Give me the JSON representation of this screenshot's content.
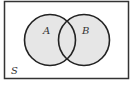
{
  "diagram": {
    "type": "venn",
    "universe": {
      "label": "S"
    },
    "sets": [
      {
        "label": "A"
      },
      {
        "label": "B"
      }
    ],
    "colors": {
      "fill": "#e6e6e6",
      "stroke": "#222222",
      "background": "#ffffff"
    }
  }
}
